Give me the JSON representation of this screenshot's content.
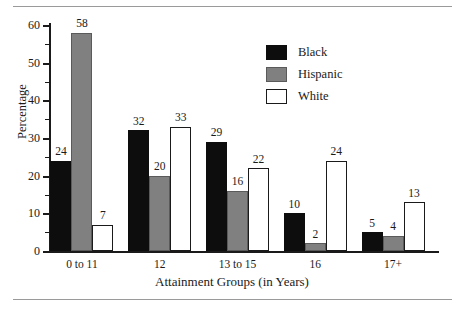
{
  "chart_data": {
    "type": "bar",
    "title": "",
    "xlabel": "Attainment Groups (in Years)",
    "ylabel": "Percentage",
    "categories": [
      "0 to 11",
      "12",
      "13 to 15",
      "16",
      "17+"
    ],
    "series": [
      {
        "name": "Black",
        "color": "#0d0d0d",
        "values": [
          24,
          32,
          29,
          10,
          5
        ]
      },
      {
        "name": "Hispanic",
        "color": "#808080",
        "values": [
          58,
          20,
          16,
          2,
          4
        ]
      },
      {
        "name": "White",
        "color": "#ffffff",
        "values": [
          7,
          33,
          22,
          24,
          13
        ]
      }
    ],
    "ylim": [
      0,
      60
    ],
    "yticks": [
      0,
      10,
      20,
      30,
      40,
      50,
      60
    ],
    "ytick_labels": [
      "0",
      "10",
      "20",
      "30",
      "40",
      "50",
      "60"
    ],
    "yminor_ticks": [
      5,
      15,
      25,
      35,
      45,
      55
    ],
    "grid": false,
    "legend_position": "top-right",
    "value_labels": true
  },
  "legend": {
    "entries": [
      {
        "label": "Black"
      },
      {
        "label": "Hispanic"
      },
      {
        "label": "White"
      }
    ]
  },
  "axes": {
    "y_title": "Percentage",
    "x_title": "Attainment Groups (in Years)"
  }
}
